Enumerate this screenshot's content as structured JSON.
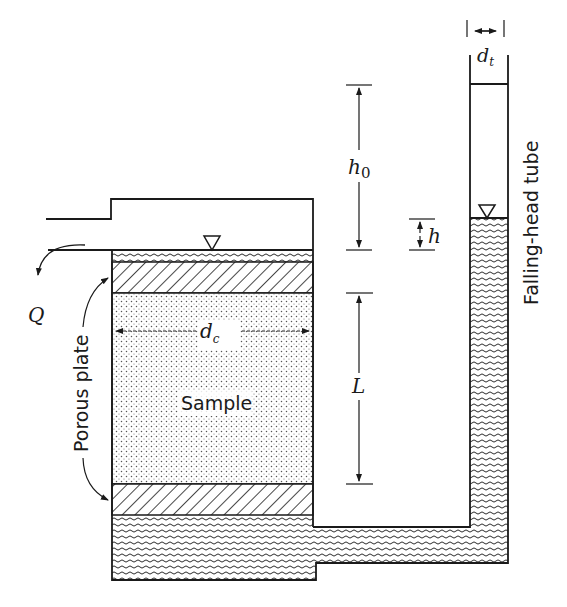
{
  "diagram": {
    "labels": {
      "tube_diameter": "d",
      "tube_diameter_sub": "t",
      "initial_head": "h",
      "initial_head_sub": "0",
      "head_drop": "h",
      "flow": "Q",
      "column_diameter": "d",
      "column_diameter_sub": "c",
      "sample_length": "L",
      "sample": "Sample",
      "porous_plate": "Porous plate",
      "falling_head_tube": "Falling-head tube"
    },
    "components": [
      "inlet-outlet reservoir",
      "top porous plate",
      "soil sample",
      "bottom porous plate",
      "bottom water chamber",
      "connecting channel",
      "falling-head standpipe"
    ],
    "colors": {
      "line": "#1a1a1a",
      "background": "#ffffff"
    }
  }
}
